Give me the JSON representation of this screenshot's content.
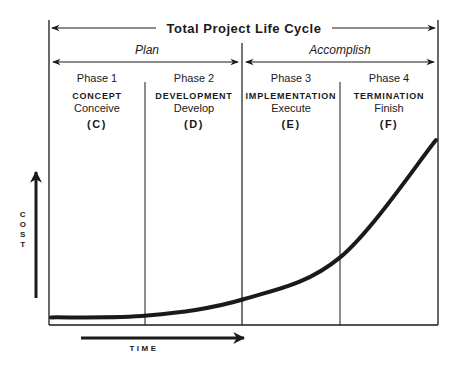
{
  "title": "Total Project Life Cycle",
  "stages": [
    {
      "label": "Plan",
      "phases": [
        1,
        2
      ]
    },
    {
      "label": "Accomplish",
      "phases": [
        3,
        4
      ]
    }
  ],
  "phases": [
    {
      "number": "Phase 1",
      "name": "CONCEPT",
      "verb": "Conceive",
      "letter": "(C)"
    },
    {
      "number": "Phase 2",
      "name": "DEVELOPMENT",
      "verb": "Develop",
      "letter": "(D)"
    },
    {
      "number": "Phase 3",
      "name": "IMPLEMENTATION",
      "verb": "Execute",
      "letter": "(E)"
    },
    {
      "number": "Phase 4",
      "name": "TERMINATION",
      "verb": "Finish",
      "letter": "(F)"
    }
  ],
  "axes": {
    "y_label": [
      "C",
      "O",
      "S",
      "T"
    ],
    "x_label": "TIME"
  },
  "curve": {
    "description": "Cost rises slowly through concept and development, then accelerates through implementation and termination",
    "points_phase_fraction": [
      [
        0.0,
        0.02
      ],
      [
        1.0,
        0.03
      ],
      [
        2.0,
        0.12
      ],
      [
        3.0,
        0.35
      ],
      [
        4.0,
        1.0
      ]
    ]
  },
  "colors": {
    "ink": "#1a1a1a",
    "background": "#ffffff"
  }
}
